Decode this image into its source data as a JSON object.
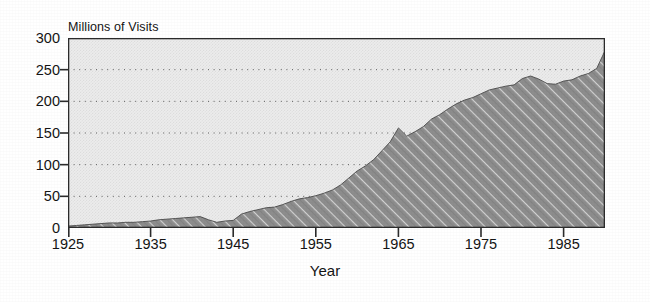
{
  "figure": {
    "background_color": "#ffffff",
    "plot_background_color": "#ebebeb",
    "area_fill_color": "#8a8a8a",
    "axis_color": "#2b2b2b",
    "grid_color": "#666666",
    "text_color": "#141414"
  },
  "chart_data": {
    "type": "area",
    "title": "",
    "subtitle": "",
    "ylabel": "Millions of Visits",
    "xlabel": "Year",
    "ylim": [
      0,
      300
    ],
    "xlim": [
      1925,
      1990
    ],
    "yticks": [
      0,
      50,
      100,
      150,
      200,
      250,
      300
    ],
    "ytick_labels": [
      "0",
      "50",
      "100",
      "150",
      "200",
      "250",
      "300"
    ],
    "xticks": [
      1925,
      1935,
      1945,
      1955,
      1965,
      1975,
      1985
    ],
    "xtick_labels": [
      "1925",
      "1935",
      "1945",
      "1955",
      "1965",
      "1975",
      "1985"
    ],
    "grid": "horizontal-dotted",
    "legend": "none",
    "series_name": "Visits",
    "x": [
      1925,
      1926,
      1927,
      1928,
      1929,
      1930,
      1931,
      1932,
      1933,
      1934,
      1935,
      1936,
      1937,
      1938,
      1939,
      1940,
      1941,
      1942,
      1943,
      1944,
      1945,
      1946,
      1947,
      1948,
      1949,
      1950,
      1951,
      1952,
      1953,
      1954,
      1955,
      1956,
      1957,
      1958,
      1959,
      1960,
      1961,
      1962,
      1963,
      1964,
      1965,
      1966,
      1967,
      1968,
      1969,
      1970,
      1971,
      1972,
      1973,
      1974,
      1975,
      1976,
      1977,
      1978,
      1979,
      1980,
      1981,
      1982,
      1983,
      1984,
      1985,
      1986,
      1987,
      1988,
      1989,
      1990
    ],
    "values": [
      3,
      4,
      5,
      6,
      7,
      8,
      8,
      9,
      9,
      10,
      11,
      13,
      14,
      15,
      16,
      17,
      18,
      13,
      9,
      11,
      12,
      22,
      26,
      29,
      32,
      33,
      37,
      42,
      46,
      48,
      51,
      55,
      60,
      68,
      79,
      90,
      98,
      108,
      122,
      136,
      158,
      145,
      152,
      160,
      172,
      179,
      188,
      196,
      202,
      206,
      212,
      218,
      221,
      224,
      226,
      236,
      240,
      235,
      228,
      227,
      232,
      234,
      240,
      244,
      252,
      280
    ],
    "annotations": [
      {
        "label": "WWII decline",
        "x": 1943,
        "y": 9
      },
      {
        "label": "1965 peak",
        "x": 1965,
        "y": 158
      }
    ]
  }
}
